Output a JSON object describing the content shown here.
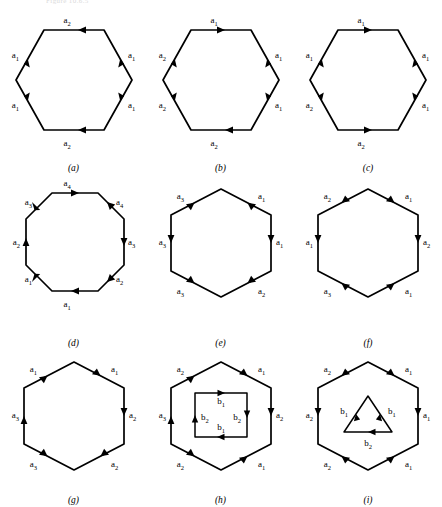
{
  "header": {
    "text": "Figure 10.6.5"
  },
  "figure": {
    "caption_style": "italic-parenthesized",
    "stroke_color": "#000000",
    "background_color": "#ffffff"
  },
  "panels": [
    {
      "id": "a",
      "caption": "(a)",
      "outer_shape": "hexagon",
      "orientation": "flat-top",
      "inner_shape": null,
      "edges": [
        {
          "position": "top",
          "label": "a",
          "sub": "2",
          "direction": "left"
        },
        {
          "position": "upper-right",
          "label": "a",
          "sub": "1",
          "direction": "up"
        },
        {
          "position": "lower-right",
          "label": "a",
          "sub": "1",
          "direction": "up"
        },
        {
          "position": "bottom",
          "label": "a",
          "sub": "2",
          "direction": "left"
        },
        {
          "position": "lower-left",
          "label": "a",
          "sub": "1",
          "direction": "up"
        },
        {
          "position": "upper-left",
          "label": "a",
          "sub": "1",
          "direction": "up"
        }
      ]
    },
    {
      "id": "b",
      "caption": "(b)",
      "outer_shape": "hexagon",
      "orientation": "flat-top",
      "inner_shape": null,
      "edges": [
        {
          "position": "top",
          "label": "a",
          "sub": "1",
          "direction": "right"
        },
        {
          "position": "upper-right",
          "label": "a",
          "sub": "1",
          "direction": "down"
        },
        {
          "position": "lower-right",
          "label": "a",
          "sub": "1",
          "direction": "down"
        },
        {
          "position": "bottom",
          "label": "a",
          "sub": "2",
          "direction": "left"
        },
        {
          "position": "lower-left",
          "label": "a",
          "sub": "2",
          "direction": "up"
        },
        {
          "position": "upper-left",
          "label": "a",
          "sub": "2",
          "direction": "up"
        }
      ]
    },
    {
      "id": "c",
      "caption": "(c)",
      "outer_shape": "hexagon",
      "orientation": "flat-top",
      "inner_shape": null,
      "edges": [
        {
          "position": "top",
          "label": "a",
          "sub": "1",
          "direction": "right"
        },
        {
          "position": "upper-right",
          "label": "a",
          "sub": "1",
          "direction": "down"
        },
        {
          "position": "lower-right",
          "label": "a",
          "sub": "1",
          "direction": "up"
        },
        {
          "position": "bottom",
          "label": "a",
          "sub": "2",
          "direction": "right"
        },
        {
          "position": "lower-left",
          "label": "a",
          "sub": "2",
          "direction": "up"
        },
        {
          "position": "upper-left",
          "label": "a",
          "sub": "1",
          "direction": "up"
        }
      ]
    },
    {
      "id": "d",
      "caption": "(d)",
      "outer_shape": "octagon",
      "orientation": "flat-top",
      "inner_shape": null,
      "edges": [
        {
          "position": "top",
          "label": "a",
          "sub": "4",
          "direction": "right"
        },
        {
          "position": "upper-right",
          "label": "a",
          "sub": "4",
          "direction": "up-left"
        },
        {
          "position": "right",
          "label": "a",
          "sub": "3",
          "direction": "down"
        },
        {
          "position": "lower-right",
          "label": "a",
          "sub": "2",
          "direction": "up-right"
        },
        {
          "position": "bottom",
          "label": "a",
          "sub": "1",
          "direction": "right"
        },
        {
          "position": "lower-left",
          "label": "a",
          "sub": "1",
          "direction": "up-left"
        },
        {
          "position": "left",
          "label": "a",
          "sub": "2",
          "direction": "up"
        },
        {
          "position": "upper-left",
          "label": "a",
          "sub": "3",
          "direction": "down-left"
        }
      ]
    },
    {
      "id": "e",
      "caption": "(e)",
      "outer_shape": "hexagon",
      "orientation": "pointy-top",
      "inner_shape": null,
      "edges": [
        {
          "position": "upper-right",
          "label": "a",
          "sub": "1",
          "direction": "up-left"
        },
        {
          "position": "right",
          "label": "a",
          "sub": "1",
          "direction": "down"
        },
        {
          "position": "lower-right",
          "label": "a",
          "sub": "2",
          "direction": "down-left"
        },
        {
          "position": "lower-left",
          "label": "a",
          "sub": "3",
          "direction": "down-right"
        },
        {
          "position": "left",
          "label": "a",
          "sub": "3",
          "direction": "down"
        },
        {
          "position": "upper-left",
          "label": "a",
          "sub": "3",
          "direction": "down-left"
        }
      ]
    },
    {
      "id": "f",
      "caption": "(f)",
      "outer_shape": "hexagon",
      "orientation": "pointy-top",
      "inner_shape": null,
      "edges": [
        {
          "position": "upper-right",
          "label": "a",
          "sub": "1",
          "direction": "down-right"
        },
        {
          "position": "right",
          "label": "a",
          "sub": "2",
          "direction": "down"
        },
        {
          "position": "lower-right",
          "label": "a",
          "sub": "1",
          "direction": "up-right"
        },
        {
          "position": "lower-left",
          "label": "a",
          "sub": "3",
          "direction": "down-right"
        },
        {
          "position": "left",
          "label": "a",
          "sub": "1",
          "direction": "down"
        },
        {
          "position": "upper-left",
          "label": "a",
          "sub": "2",
          "direction": "down-left"
        }
      ]
    },
    {
      "id": "g",
      "caption": "(g)",
      "outer_shape": "hexagon",
      "orientation": "pointy-top",
      "inner_shape": null,
      "edges": [
        {
          "position": "upper-right",
          "label": "a",
          "sub": "1",
          "direction": "down-right"
        },
        {
          "position": "right",
          "label": "a",
          "sub": "2",
          "direction": "down"
        },
        {
          "position": "lower-right",
          "label": "a",
          "sub": "2",
          "direction": "up-left"
        },
        {
          "position": "lower-left",
          "label": "a",
          "sub": "3",
          "direction": "up-left"
        },
        {
          "position": "left",
          "label": "a",
          "sub": "3",
          "direction": "up"
        },
        {
          "position": "upper-left",
          "label": "a",
          "sub": "1",
          "direction": "up-right"
        }
      ]
    },
    {
      "id": "h",
      "caption": "(h)",
      "outer_shape": "hexagon",
      "orientation": "pointy-top",
      "inner_shape": "square",
      "edges": [
        {
          "position": "upper-right",
          "label": "a",
          "sub": "1",
          "direction": "down-right"
        },
        {
          "position": "right",
          "label": "a",
          "sub": "2",
          "direction": "down"
        },
        {
          "position": "lower-right",
          "label": "a",
          "sub": "1",
          "direction": "down-left"
        },
        {
          "position": "lower-left",
          "label": "a",
          "sub": "2",
          "direction": "up-left"
        },
        {
          "position": "left",
          "label": "a",
          "sub": "3",
          "direction": "up"
        },
        {
          "position": "upper-left",
          "label": "a",
          "sub": "2",
          "direction": "up-right"
        }
      ],
      "inner_edges": [
        {
          "position": "top",
          "label": "b",
          "sub": "1",
          "direction": "right"
        },
        {
          "position": "right",
          "label": "b",
          "sub": "2",
          "direction": "down"
        },
        {
          "position": "bottom",
          "label": "b",
          "sub": "1",
          "direction": "left"
        },
        {
          "position": "left",
          "label": "b",
          "sub": "2",
          "direction": "up"
        }
      ]
    },
    {
      "id": "i",
      "caption": "(i)",
      "outer_shape": "hexagon",
      "orientation": "pointy-top",
      "inner_shape": "triangle",
      "edges": [
        {
          "position": "upper-right",
          "label": "a",
          "sub": "1",
          "direction": "down-right"
        },
        {
          "position": "right",
          "label": "a",
          "sub": "1",
          "direction": "down"
        },
        {
          "position": "lower-right",
          "label": "a",
          "sub": "1",
          "direction": "down-left"
        },
        {
          "position": "lower-left",
          "label": "a",
          "sub": "2",
          "direction": "down-right"
        },
        {
          "position": "left",
          "label": "a",
          "sub": "2",
          "direction": "down"
        },
        {
          "position": "upper-left",
          "label": "a",
          "sub": "2",
          "direction": "up-right"
        }
      ],
      "inner_edges": [
        {
          "position": "left",
          "label": "b",
          "sub": "1",
          "direction": "up-right"
        },
        {
          "position": "right",
          "label": "b",
          "sub": "1",
          "direction": "down-right"
        },
        {
          "position": "bottom",
          "label": "b",
          "sub": "2",
          "direction": "left"
        }
      ]
    }
  ]
}
